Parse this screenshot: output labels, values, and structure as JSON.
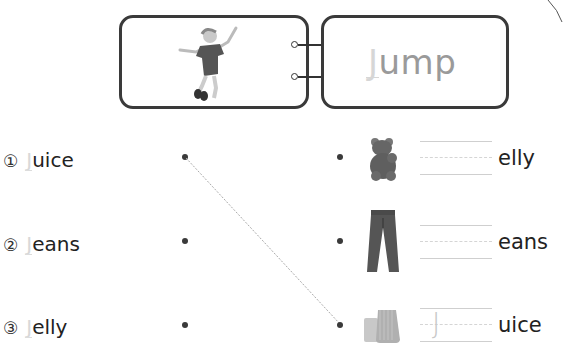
{
  "header": {
    "picture_alt": "child jumping",
    "word_first_letter": "J",
    "word_rest": "ump"
  },
  "left_items": [
    {
      "number": "①",
      "first_letter": "J",
      "rest": "uice"
    },
    {
      "number": "②",
      "first_letter": "J",
      "rest": "eans"
    },
    {
      "number": "③",
      "first_letter": "J",
      "rest": "elly"
    }
  ],
  "right_items": [
    {
      "picture": "gummy bear (jelly)",
      "traced_letter": "",
      "rest": "elly"
    },
    {
      "picture": "jeans",
      "traced_letter": "",
      "rest": "eans"
    },
    {
      "picture": "glass of juice",
      "traced_letter": "J",
      "rest": "uice"
    }
  ],
  "connections": [
    {
      "from": "left-1",
      "to": "right-3",
      "style": "dashed"
    }
  ]
}
